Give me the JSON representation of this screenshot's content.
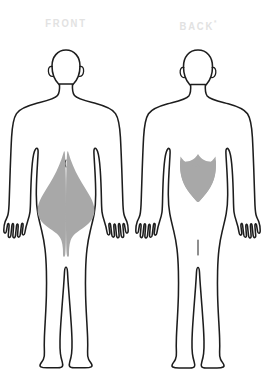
{
  "diagram": {
    "kind": "body-pain-location-chart",
    "background_color": "#ffffff",
    "outline_color": "#1d1d1d",
    "shading_color": "#a8a8a8",
    "label_color": "#e2e2e2",
    "panels": [
      {
        "id": "front",
        "label": "FRONT",
        "label_superscript": "",
        "view": "anterior",
        "shaded_regions": [
          {
            "name": "right-groin-inner-thigh",
            "side": "right",
            "description": "Wing-shaped shading over lower abdomen, groin and medial thigh"
          },
          {
            "name": "left-groin-inner-thigh",
            "side": "left",
            "description": "Mirrored wing-shaped shading over lower abdomen, groin and medial thigh"
          }
        ],
        "shaded_region_count": 2
      },
      {
        "id": "back",
        "label": "BACK",
        "label_superscript": "*",
        "view": "posterior",
        "shaded_regions": [
          {
            "name": "lumbar-lower-back",
            "side": "central",
            "description": "Shield-shaped shading over the lower back / lumbar region"
          }
        ],
        "shaded_region_count": 1
      }
    ]
  }
}
